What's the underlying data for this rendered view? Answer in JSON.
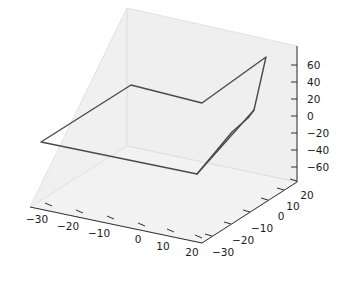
{
  "figure": {
    "background_color": "#ffffff",
    "pane_color": "#efefef",
    "pane_edge_color": "#d8d8d8",
    "axis_line_color": "#303030",
    "tick_color": "#303030",
    "tick_label_color": "#1a1a1a",
    "line_color": "#4a4a4a",
    "line_width": 1.4
  },
  "chart_data": {
    "type": "line",
    "projection": "3d",
    "title": "",
    "xlabel": "",
    "ylabel": "",
    "zlabel": "",
    "grid": false,
    "legend": null,
    "xlim": [
      -35,
      25
    ],
    "ylim": [
      -35,
      25
    ],
    "zlim": [
      -70,
      70
    ],
    "xticks": [
      -30,
      -20,
      -10,
      0,
      10,
      20
    ],
    "yticks": [
      -30,
      -20,
      -10,
      0,
      10,
      20
    ],
    "zticks": [
      -60,
      -40,
      -20,
      0,
      20,
      40,
      60
    ],
    "xticklabels": [
      "−30",
      "−20",
      "−10",
      "0",
      "10",
      "20"
    ],
    "yticklabels": [
      "−30",
      "−20",
      "−10",
      "0",
      "10",
      "20"
    ],
    "zticklabels": [
      "−60",
      "−40",
      "−20",
      "0",
      "20",
      "40",
      "60"
    ],
    "series": [
      {
        "name": "trajectory",
        "x": [
          -32,
          -4,
          14,
          22,
          18,
          2,
          -32
        ],
        "y": [
          -30,
          4,
          -8,
          20,
          -6,
          -30,
          -30
        ],
        "z": [
          -18,
          22,
          8,
          62,
          2,
          -44,
          -18
        ]
      }
    ],
    "screen_path": [
      [
        41,
        142
      ],
      [
        131,
        85
      ],
      [
        202,
        103
      ],
      [
        266,
        57
      ],
      [
        254,
        110
      ],
      [
        197,
        174
      ],
      [
        41,
        142
      ]
    ],
    "screen_path_spike": [
      [
        197,
        174
      ],
      [
        232,
        132
      ],
      [
        248,
        118
      ],
      [
        254,
        110
      ]
    ]
  },
  "axes_geometry": {
    "pane_top_back": [
      [
        127,
        8
      ],
      [
        297,
        46
      ],
      [
        297,
        46
      ]
    ],
    "origin_corner": [
      202,
      243
    ],
    "z_axis_x": 297,
    "z_axis_top_y": 46,
    "z_axis_bottom_y": 182,
    "x_axis_start": [
      30,
      207
    ],
    "x_axis_end": [
      202,
      243
    ],
    "y_axis_start": [
      202,
      243
    ],
    "y_axis_end": [
      297,
      182
    ]
  },
  "xtick_positions": [
    {
      "label": "−30",
      "tx": 52,
      "ty": 206,
      "lx": 37,
      "ly": 223
    },
    {
      "label": "−20",
      "tx": 83,
      "ty": 213,
      "lx": 68,
      "ly": 230
    },
    {
      "label": "−10",
      "tx": 114,
      "ty": 219,
      "lx": 99,
      "ly": 237
    },
    {
      "label": "0",
      "tx": 145,
      "ty": 226,
      "lx": 138,
      "ly": 243
    },
    {
      "label": "10",
      "tx": 174,
      "ty": 232,
      "lx": 163,
      "ly": 250
    },
    {
      "label": "20",
      "tx": 202,
      "ty": 238,
      "lx": 192,
      "ly": 256
    }
  ],
  "ytick_positions": [
    {
      "label": "−30",
      "tx": 212,
      "ty": 236,
      "lx": 223,
      "ly": 256
    },
    {
      "label": "−20",
      "tx": 231,
      "ty": 224,
      "lx": 243,
      "ly": 244
    },
    {
      "label": "−10",
      "tx": 250,
      "ty": 212,
      "lx": 262,
      "ly": 232
    },
    {
      "label": "0",
      "tx": 268,
      "ty": 200,
      "lx": 281,
      "ly": 220
    },
    {
      "label": "10",
      "tx": 284,
      "ty": 190,
      "lx": 293,
      "ly": 210
    },
    {
      "label": "20",
      "tx": 297,
      "ty": 181,
      "lx": 307,
      "ly": 199
    }
  ],
  "ztick_positions": [
    {
      "label": "60",
      "ty": 65
    },
    {
      "label": "40",
      "ty": 82
    },
    {
      "label": "20",
      "ty": 99
    },
    {
      "label": "0",
      "ty": 116
    },
    {
      "label": "−20",
      "ty": 133
    },
    {
      "label": "−40",
      "ty": 150
    },
    {
      "label": "−60",
      "ty": 167
    }
  ]
}
